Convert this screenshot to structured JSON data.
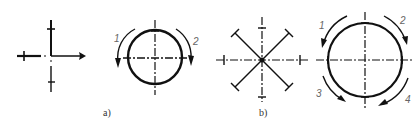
{
  "figure": {
    "panels": [
      {
        "id": "a",
        "caption": "a)",
        "left": {
          "type": "cross",
          "arms": 4
        },
        "right": {
          "type": "circle-with-rotation",
          "arrows": [
            {
              "label": "1",
              "position": "left"
            },
            {
              "label": "2",
              "position": "right"
            }
          ]
        }
      },
      {
        "id": "b",
        "caption": "b)",
        "left": {
          "type": "star",
          "arms": 8
        },
        "right": {
          "type": "circle-with-rotation",
          "arrows": [
            {
              "label": "1",
              "position": "upper-left"
            },
            {
              "label": "3",
              "position": "upper-right"
            },
            {
              "label": "2",
              "position": "lower-left"
            },
            {
              "label": "4",
              "position": "lower-right"
            }
          ]
        }
      }
    ],
    "colors": {
      "ink": "#111111",
      "label": "#666666",
      "background": "#ffffff"
    }
  }
}
